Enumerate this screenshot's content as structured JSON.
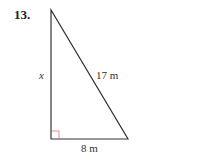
{
  "problem": {
    "number": "13.",
    "figure": {
      "type": "right-triangle",
      "vertices": {
        "top": [
          51,
          10
        ],
        "right_angle": [
          51,
          139
        ],
        "bottom_right": [
          128,
          139
        ]
      },
      "labels": {
        "vertical_leg": "x",
        "hypotenuse": "17 m",
        "horizontal_leg": "8 m"
      },
      "colors": {
        "stroke": "#333333",
        "right_angle_marker": "#e07070"
      }
    }
  }
}
